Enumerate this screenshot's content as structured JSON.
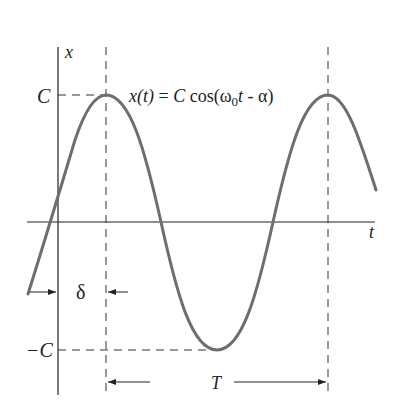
{
  "diagram": {
    "type": "sinusoid-annotated",
    "equation": {
      "lhs": "x(t)",
      "eq": " = ",
      "C": "C",
      "cos": " cos(ω",
      "sub": "0",
      "t": "t",
      "rest": " - α)"
    },
    "axes": {
      "x_axis_label": "t",
      "y_axis_label": "x"
    },
    "levels": {
      "top": "C",
      "bottom": "−C"
    },
    "annotations": {
      "phase_shift": "δ",
      "period": "T"
    },
    "colors": {
      "curve": "#6e6e6e",
      "axes": "#222222",
      "dashed": "#333333"
    }
  }
}
